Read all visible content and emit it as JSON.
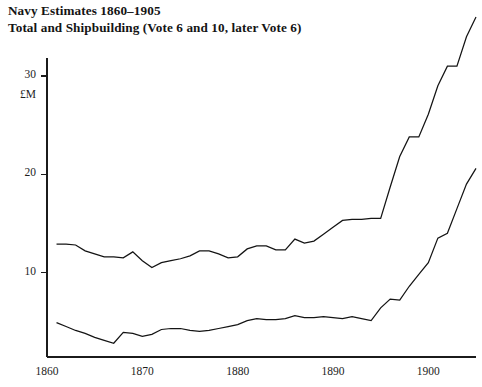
{
  "chart_data": {
    "type": "line",
    "title": "Navy Estimates 1860–1905",
    "subtitle": "Total and Shipbuilding (Vote 6 and 10, later Vote 6)",
    "xlabel": "",
    "ylabel": "£M",
    "unit_label": "£M",
    "xlim": [
      1860,
      1905
    ],
    "ylim": [
      0,
      36
    ],
    "grid": false,
    "legend": "none",
    "xticks": [
      1860,
      1870,
      1880,
      1890,
      1900
    ],
    "xtick_labels": [
      "1860",
      "1870",
      "1880",
      "1890",
      "1900"
    ],
    "yticks": [
      10,
      20,
      30
    ],
    "ytick_labels": [
      "10",
      "20",
      "30"
    ],
    "x": [
      1861,
      1862,
      1863,
      1864,
      1865,
      1866,
      1867,
      1868,
      1869,
      1870,
      1871,
      1872,
      1873,
      1874,
      1875,
      1876,
      1877,
      1878,
      1879,
      1880,
      1881,
      1882,
      1883,
      1884,
      1885,
      1886,
      1887,
      1888,
      1889,
      1890,
      1891,
      1892,
      1893,
      1894,
      1895,
      1896,
      1897,
      1898,
      1899,
      1900,
      1901,
      1902,
      1903,
      1904,
      1905
    ],
    "series": [
      {
        "name": "Total",
        "values": [
          12.9,
          12.9,
          12.8,
          12.2,
          11.9,
          11.6,
          11.6,
          11.5,
          12.1,
          11.2,
          10.5,
          11.0,
          11.2,
          11.4,
          11.7,
          12.2,
          12.2,
          11.9,
          11.5,
          11.6,
          12.4,
          12.7,
          12.7,
          12.3,
          12.3,
          13.4,
          13.0,
          13.2,
          13.9,
          14.6,
          15.3,
          15.4,
          15.4,
          15.5,
          15.5,
          18.7,
          21.8,
          23.8,
          23.8,
          26.1,
          29.0,
          31.0,
          31.0,
          34.0,
          36.0
        ]
      },
      {
        "name": "Shipbuilding",
        "values": [
          4.9,
          4.5,
          4.1,
          3.8,
          3.4,
          3.1,
          2.8,
          3.9,
          3.8,
          3.5,
          3.7,
          4.2,
          4.3,
          4.3,
          4.1,
          4.0,
          4.1,
          4.3,
          4.5,
          4.7,
          5.1,
          5.3,
          5.2,
          5.2,
          5.3,
          5.6,
          5.4,
          5.4,
          5.5,
          5.4,
          5.3,
          5.5,
          5.3,
          5.1,
          6.4,
          7.3,
          7.2,
          8.6,
          9.8,
          11.0,
          13.5,
          14.0,
          16.5,
          19.0,
          20.6
        ]
      }
    ]
  }
}
